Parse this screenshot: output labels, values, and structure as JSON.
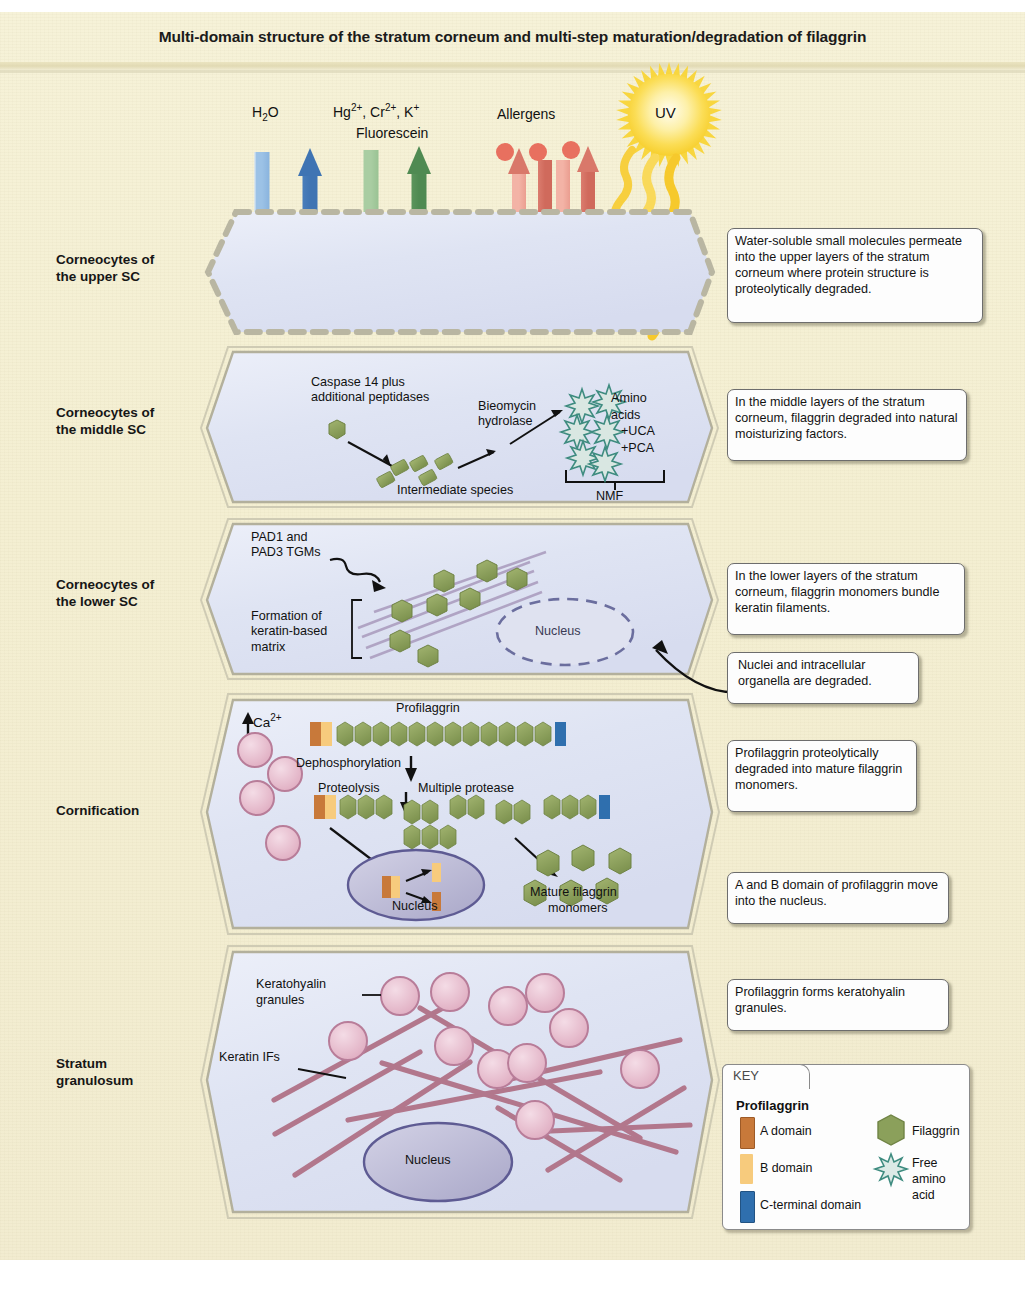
{
  "figure": {
    "title": "Multi-domain structure of the stratum corneum and multi-step maturation/degradation of filaggrin"
  },
  "penetrants": [
    {
      "name": "water",
      "label": "H₂O",
      "color": "#5b8fc9"
    },
    {
      "name": "metal-ions",
      "label": "Hg²⁺, Cr²⁺, K⁺",
      "label2": "Fluorescein",
      "color": "#6ba濃"
    },
    {
      "name": "allergens",
      "label": "Allergens",
      "color": "#e08070"
    },
    {
      "name": "uv",
      "label": "UV",
      "color": "#f6d33c"
    }
  ],
  "penetrant_labels": {
    "water": "H",
    "water_sub": "2",
    "water_end": "O",
    "ions_line1_a": "Hg",
    "ions_sup1": "2+",
    "ions_line1_b": ", Cr",
    "ions_sup2": "2+",
    "ions_line1_c": ", K",
    "ions_sup3": "+",
    "ions_line2": "Fluorescein",
    "allergens": "Allergens",
    "uv": "UV"
  },
  "rows": [
    {
      "name": "upper-sc",
      "label_line1": "Corneocytes of",
      "label_line2": "the upper SC"
    },
    {
      "name": "middle-sc",
      "label_line1": "Corneocytes of",
      "label_line2": "the middle SC"
    },
    {
      "name": "lower-sc",
      "label_line1": "Corneocytes of",
      "label_line2": "the lower SC"
    },
    {
      "name": "cornification",
      "label_line1": "Cornification",
      "label_line2": ""
    },
    {
      "name": "stratum-granulosum",
      "label_line1": "Stratum",
      "label_line2": "granulosum"
    }
  ],
  "callouts": [
    {
      "name": "callout-upper-sc",
      "text": "Water-soluble small molecules permeate into the upper layers of the stratum corneum where protein structure is proteolytically degraded."
    },
    {
      "name": "callout-middle-sc",
      "text": "In the middle layers of the stratum corneum, filaggrin degraded into natural moisturizing factors."
    },
    {
      "name": "callout-lower-sc",
      "text": "In the lower layers of the stratum corneum, filaggrin monomers bundle keratin filaments."
    },
    {
      "name": "callout-nuclei",
      "text": "Nuclei and intracellular organella are degraded."
    },
    {
      "name": "callout-profilaggrin-degraded",
      "text": "Profilaggrin proteolytically degraded into mature filaggrin monomers."
    },
    {
      "name": "callout-ab-domain",
      "text": "A and B domain of profilaggrin move into the nucleus."
    },
    {
      "name": "callout-keratohyalin",
      "text": "Profilaggrin forms keratohyalin granules."
    }
  ],
  "middle_sc": {
    "caspase_line1": "Caspase 14 plus",
    "caspase_line2": "additional peptidases",
    "bleomycin_line1": "Bieomycin",
    "bleomycin_line2": "hydrolase",
    "intermediate": "Intermediate species",
    "amino_line1": "Amino",
    "amino_line2": "acids",
    "amino_line3": "+UCA",
    "amino_line4": "+PCA",
    "nmf": "NMF"
  },
  "lower_sc": {
    "pad_line1": "PAD1 and",
    "pad_line2": "PAD3 TGMs",
    "matrix_line1": "Formation of",
    "matrix_line2": "keratin-based",
    "matrix_line3": "matrix",
    "nucleus": "Nucleus"
  },
  "cornification": {
    "calcium": "Ca",
    "calcium_sup": "2+",
    "profilaggrin": "Profilaggrin",
    "dephosphorylation": "Dephosphorylation",
    "proteolysis": "Proteolysis",
    "multiple_protease": "Multiple protease",
    "nucleus": "Nucleus",
    "mature_line1": "Mature filaggrin",
    "mature_line2": "monomers"
  },
  "granulosum": {
    "granules_line1": "Keratohyalin",
    "granules_line2": "granules",
    "keratin_ifs": "Keratin IFs",
    "nucleus": "Nucleus"
  },
  "key": {
    "tab": "KEY",
    "title": "Profilaggrin",
    "items": [
      {
        "name": "a-domain",
        "label": "A domain",
        "color": "#c8793a",
        "shape": "bar"
      },
      {
        "name": "b-domain",
        "label": "B domain",
        "color": "#f7cb7d",
        "shape": "bar"
      },
      {
        "name": "c-terminal-domain",
        "label": "C-terminal domain",
        "color": "#2f6fae",
        "shape": "bar"
      },
      {
        "name": "filaggrin",
        "label": "Filaggrin",
        "color": "#8ba05b",
        "shape": "hexagon"
      },
      {
        "name": "free-amino-acid",
        "label_line1": "Free",
        "label_line2": "amino",
        "label_line3": "acid",
        "color": "#4e9c8f",
        "shape": "starburst"
      }
    ]
  },
  "colors": {
    "paper": "#f3eed1",
    "cell_fill": "#e3e7f5",
    "cell_border": "#9a9a86",
    "filaggrin": "#8ba05b",
    "a_domain": "#c8793a",
    "b_domain": "#f7cb7d",
    "c_terminal": "#2f6fae",
    "granule": "#e7bcca",
    "keratin": "#b2778c",
    "nucleus": "#b9b7d6",
    "uv": "#f6d33c",
    "water_arrow": "#5b8fc9",
    "ion_arrow": "#7aab77",
    "allergen_arrow": "#e2887a",
    "amino_acid": "#4e9c8f"
  }
}
